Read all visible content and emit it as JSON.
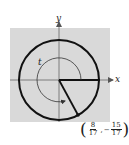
{
  "diagram": {
    "type": "unit-circle",
    "axes": {
      "x_label": "x",
      "y_label": "y"
    },
    "angle_label": "t",
    "point": {
      "x": {
        "sign": "",
        "numerator": "8",
        "denominator": "17"
      },
      "separator": ",",
      "y": {
        "sign": "−",
        "numerator": "15",
        "denominator": "17"
      },
      "open": "(",
      "close": ")"
    },
    "colors": {
      "background": "#d9d9d9",
      "stroke": "#111111"
    }
  }
}
